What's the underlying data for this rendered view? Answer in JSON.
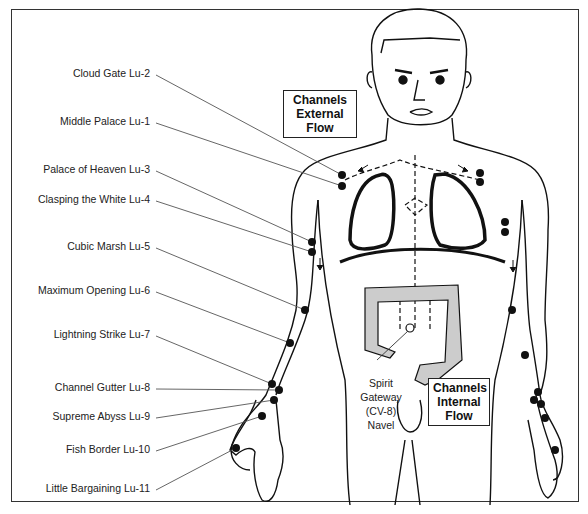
{
  "points": [
    {
      "label": "Cloud Gate Lu-2",
      "lx": 150,
      "ly": 73,
      "px": 342,
      "py": 175
    },
    {
      "label": "Middle Palace Lu-1",
      "lx": 150,
      "ly": 121,
      "px": 342,
      "py": 186
    },
    {
      "label": "Palace of Heaven Lu-3",
      "lx": 150,
      "ly": 169,
      "px": 312,
      "py": 242
    },
    {
      "label": "Clasping the White Lu-4",
      "lx": 150,
      "ly": 199,
      "px": 312,
      "py": 252
    },
    {
      "label": "Cubic Marsh Lu-5",
      "lx": 150,
      "ly": 246,
      "px": 305,
      "py": 310
    },
    {
      "label": "Maximum Opening Lu-6",
      "lx": 150,
      "ly": 290,
      "px": 290,
      "py": 343
    },
    {
      "label": "Lightning Strike Lu-7",
      "lx": 150,
      "ly": 334,
      "px": 272,
      "py": 384
    },
    {
      "label": "Channel Gutter Lu-8",
      "lx": 150,
      "ly": 387,
      "px": 279,
      "py": 390
    },
    {
      "label": "Supreme Abyss Lu-9",
      "lx": 150,
      "ly": 416,
      "px": 274,
      "py": 400
    },
    {
      "label": "Fish Border Lu-10",
      "lx": 150,
      "ly": 449,
      "px": 262,
      "py": 416
    },
    {
      "label": "Little Bargaining Lu-11",
      "lx": 150,
      "ly": 488,
      "px": 236,
      "py": 448
    }
  ],
  "external_box": {
    "line1": "Channels",
    "line2": "External",
    "line3": "Flow"
  },
  "internal_box": {
    "line1": "Channels",
    "line2": "Internal",
    "line3": "Flow"
  },
  "navel_label": {
    "line1": "Spirit",
    "line2": "Gateway",
    "line3": "(CV-8)",
    "line4": "Navel"
  },
  "colors": {
    "line": "#111111",
    "leader": "#555555",
    "text": "#222222"
  }
}
